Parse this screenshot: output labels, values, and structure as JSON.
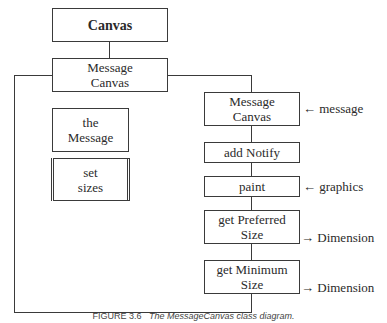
{
  "diagram": {
    "root": {
      "label": "Canvas"
    },
    "class_box": {
      "line1": "Message",
      "line2": "Canvas"
    },
    "fields": [
      {
        "line1": "the",
        "line2": "Message"
      },
      {
        "line1": "set",
        "line2": "sizes"
      }
    ],
    "methods": [
      {
        "line1": "Message",
        "line2": "Canvas",
        "annotation": "message",
        "annotation_arrow": "←"
      },
      {
        "line1": "add Notify",
        "line2": ""
      },
      {
        "line1": "paint",
        "line2": "",
        "annotation": "graphics",
        "annotation_arrow": "←"
      },
      {
        "line1": "get Preferred",
        "line2": "Size",
        "annotation": "Dimension",
        "annotation_arrow": "→"
      },
      {
        "line1": "get Minimum",
        "line2": "Size",
        "annotation": "Dimension",
        "annotation_arrow": "→"
      }
    ],
    "caption": {
      "number": "FIGURE 3.6",
      "title": "The MessageCanvas class diagram."
    }
  }
}
